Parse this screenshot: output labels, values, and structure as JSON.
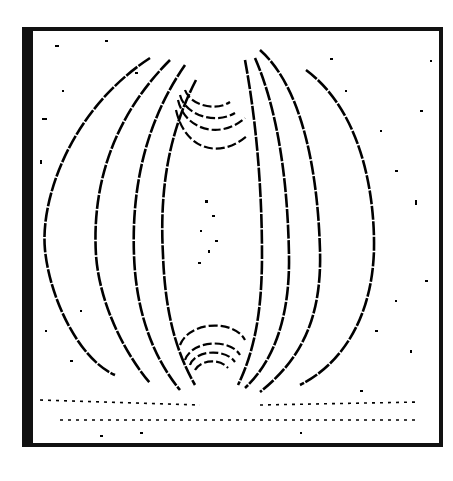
{
  "figure": {
    "colors": {
      "ink": "#000000",
      "paper": "#ffffff"
    },
    "poles": [
      {
        "name": "top-pole",
        "x": 208,
        "y": 70
      },
      {
        "name": "bottom-pole",
        "x": 210,
        "y": 378
      }
    ],
    "field_line_count_each_side": 4,
    "pole_arc_count": 4
  }
}
